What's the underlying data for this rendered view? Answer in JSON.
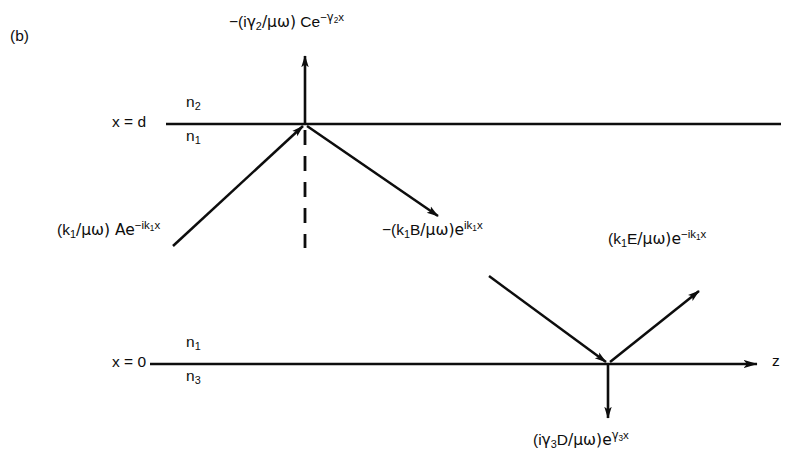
{
  "figure": {
    "panel_letter": "(b)"
  },
  "axes": {
    "z_axis_label": "z",
    "interface_top": {
      "position_label": "x = d",
      "medium_above": {
        "symbol": "n",
        "index": "2"
      },
      "medium_below": {
        "symbol": "n",
        "index": "1"
      }
    },
    "interface_bottom": {
      "position_label": "x = 0",
      "medium_above": {
        "symbol": "n",
        "index": "1"
      },
      "medium_below": {
        "symbol": "n",
        "index": "3"
      }
    }
  },
  "waves": {
    "evanescent_upper": {
      "name": "C",
      "sign": "−",
      "prefactor_open": "(i",
      "greek": "γ",
      "greek_sub": "2",
      "denominator": "/μω)",
      "amplitude": " Ce",
      "exp_sign": "−",
      "exp_greek": "γ",
      "exp_sub": "2",
      "exp_var": "x",
      "full_text": "−(iγ₂/μω) Ce^(−γ₂x)"
    },
    "incident_A": {
      "prefactor_open": "(k",
      "prefactor_sub": "1",
      "denominator": "/μω) Ae",
      "exp_sign": "−",
      "exp_body": "ik",
      "exp_sub": "1",
      "exp_var": "x",
      "full_text": "(k₁/μω) Ae^(−ik₁x)"
    },
    "reflected_B": {
      "sign": "−",
      "prefactor_open": "(k",
      "prefactor_sub": "1",
      "amplitude": "B",
      "denominator": "/μω)e",
      "exp_body": "ik",
      "exp_sub": "1",
      "exp_var": "x",
      "full_text": "−(k₁B/μω)e^(ik₁x)"
    },
    "outgoing_E": {
      "prefactor_open": "(k",
      "prefactor_sub": "1",
      "amplitude": "E",
      "denominator": "/μω)e",
      "exp_sign": "−",
      "exp_body": "ik",
      "exp_sub": "1",
      "exp_var": "x",
      "full_text": "(k₁E/μω)e^(−ik₁x)"
    },
    "evanescent_lower": {
      "prefactor_open": "(i",
      "greek": "γ",
      "greek_sub": "3",
      "amplitude": "D",
      "denominator": "/μω)e",
      "exp_greek": "γ",
      "exp_sub": "3",
      "exp_var": "x",
      "full_text": "(iγ₃D/μω)e^(γ₃x)"
    }
  },
  "colors": {
    "ink": "#0d0d0d",
    "background": "#ffffff"
  },
  "geometry": {
    "interface_top_y": 124,
    "interface_bottom_y": 364,
    "junction_top_x": 305,
    "junction_bottom_x": 608
  }
}
